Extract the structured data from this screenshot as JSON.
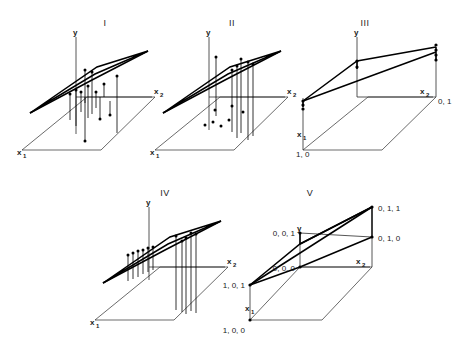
{
  "figure": {
    "background": "#ffffff",
    "ink_color": "#1a1a1a",
    "width": 467,
    "height": 340,
    "panel_count": 5
  },
  "axis_names": {
    "y": "y",
    "x1_base": "x",
    "x1_sub": "1",
    "x2_base": "x",
    "x2_sub": "2"
  },
  "panels": [
    {
      "id": "panel-1",
      "title": "I",
      "kind": "scatter-with-stems",
      "description": "Fitted plane with vertical residual stems and data points both above and below the surface",
      "axes": [
        "y",
        "x1",
        "x2"
      ],
      "coordinate_labels": [],
      "stem_count": 12,
      "base_dot_count": 0
    },
    {
      "id": "panel-2",
      "title": "II",
      "kind": "scatter-with-stems-and-base-dots",
      "description": "Fitted plane with clustered vertical stems and projected points on the base plane",
      "axes": [
        "y",
        "x1",
        "x2"
      ],
      "coordinate_labels": [],
      "stem_count": 6,
      "base_dot_count": 7
    },
    {
      "id": "panel-3",
      "title": "III",
      "kind": "two-level-indicator",
      "description": "Plane over a binary indicator design with two stacked point groups",
      "axes": [
        "y",
        "x1",
        "x2"
      ],
      "coordinate_labels": [
        {
          "text": "1, 0",
          "anchor": "start",
          "at": "x1-corner"
        },
        {
          "text": "0, 1",
          "anchor": "start",
          "at": "x2-corner"
        }
      ],
      "stem_count": 0,
      "base_dot_count": 0
    },
    {
      "id": "panel-4",
      "title": "IV",
      "kind": "two-group-stems",
      "description": "Fitted plane with two separated clusters of vertical stems",
      "axes": [
        "y",
        "x1",
        "x2"
      ],
      "coordinate_labels": [],
      "stem_count": 11,
      "base_dot_count": 0
    },
    {
      "id": "panel-5",
      "title": "V",
      "kind": "three-level-indicator",
      "description": "Plane over a three-level indicator design with labelled vertex coordinates",
      "axes": [
        "y",
        "x1",
        "x2"
      ],
      "coordinate_labels": [
        {
          "text": "0, 0, 1",
          "anchor": "end",
          "at": "y-top"
        },
        {
          "text": "0, 0, 0",
          "anchor": "end",
          "at": "origin"
        },
        {
          "text": "1, 0, 1",
          "anchor": "end",
          "at": "x1-top"
        },
        {
          "text": "1, 0, 0",
          "anchor": "end",
          "at": "x1-corner"
        },
        {
          "text": "0, 1, 1",
          "anchor": "start",
          "at": "x2-top"
        },
        {
          "text": "0, 1, 0",
          "anchor": "start",
          "at": "x2-corner"
        }
      ],
      "stem_count": 0,
      "base_dot_count": 0
    }
  ]
}
